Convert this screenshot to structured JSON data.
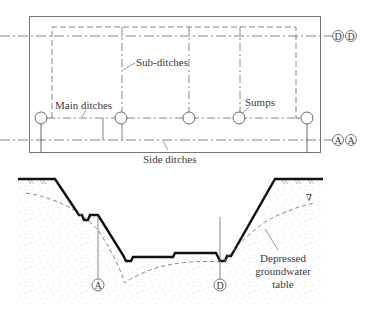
{
  "plan_view": {
    "labels": {
      "sub_ditches": "Sub-ditches",
      "main_ditches": "Main ditches",
      "sumps": "Sumps",
      "side_ditches": "Side ditches"
    },
    "section_markers": {
      "top_left": "D",
      "top_right": "D",
      "bottom_left": "A",
      "bottom_right": "A"
    }
  },
  "cross_section": {
    "markers": {
      "left": "A",
      "right": "D"
    },
    "labels": {
      "groundwater_line1": "Depressed",
      "groundwater_line2": "groundwater",
      "groundwater_line3": "table",
      "water_level_symbol": "∇"
    }
  },
  "colors": {
    "line": "#555555",
    "ground": "#111111",
    "soil_speckle": "#c8c8c8"
  }
}
